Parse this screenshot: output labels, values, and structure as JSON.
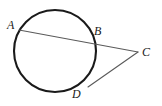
{
  "figure": {
    "background_color": "#ffffff",
    "width": 162,
    "height": 106
  },
  "styles": {
    "circle_stroke_color": "#1a1a1a",
    "circle_stroke_width": 2.1,
    "line_stroke_color": "#5a5a5a",
    "line_stroke_width": 1.1,
    "label_color": "#1a1a1a"
  },
  "circle": {
    "name": "circle",
    "cx": 55,
    "cy": 51,
    "r": 41
  },
  "points": [
    {
      "id": "A",
      "label": "A",
      "x": 19,
      "y": 30,
      "role": "secant-entry-point"
    },
    {
      "id": "B",
      "label": "B",
      "x": 91,
      "y": 40,
      "role": "secant-exit-point"
    },
    {
      "id": "C",
      "label": "C",
      "x": 138,
      "y": 52,
      "role": "external-vertex"
    },
    {
      "id": "D",
      "label": "D",
      "x": 88,
      "y": 87,
      "role": "tangent-point"
    }
  ],
  "segments": [
    {
      "id": "AC",
      "label": "secant-line-AC",
      "x1": 19,
      "y1": 30,
      "x2": 138,
      "y2": 52
    },
    {
      "id": "DC",
      "label": "tangent-line-DC",
      "x1": 88,
      "y1": 87,
      "x2": 138,
      "y2": 52
    }
  ]
}
